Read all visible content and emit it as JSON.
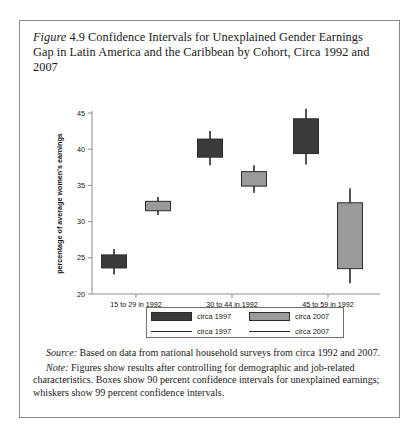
{
  "figure": {
    "label": "Figure",
    "number": "4.9",
    "title": "Confidence Intervals for Unexplained Gender Earnings Gap in Latin America and the Caribbean by Cohort, Circa 1992 and 2007"
  },
  "notes": {
    "source_lead": "Source:",
    "source_text": " Based on data from national household surveys from circa 1992 and 2007.",
    "note_lead": "Note:",
    "note_text": " Figures show results after controlling for demographic and job-related characteristics. Boxes show 90 percent confidence intervals for unexplained earnings; whiskers show 99 percent confidence intervals."
  },
  "legend": {
    "box_1997": "circa 1997",
    "box_2007": "circa 2007",
    "line_1997": "circa 1997",
    "line_2007": "circa 2007"
  },
  "colors": {
    "series_1997": "#3a3a3a",
    "series_2007": "#9a9a9a",
    "outline": "#2b2b2b",
    "axis": "#8c8c8c",
    "frame": "#8a8a8a"
  },
  "chart_data": {
    "type": "bar",
    "title": "Confidence Intervals for Unexplained Gender Earnings Gap in Latin America and the Caribbean by Cohort, Circa 1992 and 2007",
    "xlabel": "cohort",
    "ylabel": "percentage of average women's earnings",
    "ylim": [
      20,
      45
    ],
    "yticks": [
      20,
      25,
      30,
      35,
      40,
      45
    ],
    "ytick_labels": [
      "20",
      "25",
      "30",
      "35",
      "40",
      "45"
    ],
    "grid": false,
    "legend_position": "below-axis",
    "categories": [
      "15 to 29 in 1992",
      "30 to 44 in 1992",
      "45 to 59 in 1992"
    ],
    "series": [
      {
        "name": "circa 1997",
        "color": "#3a3a3a",
        "box_low": [
          23.6,
          38.9,
          39.4
        ],
        "box_high": [
          25.4,
          41.4,
          44.2
        ],
        "whisker_low": [
          22.7,
          37.8,
          37.9
        ],
        "whisker_high": [
          26.2,
          42.5,
          45.6
        ]
      },
      {
        "name": "circa 2007",
        "color": "#9a9a9a",
        "box_low": [
          31.5,
          34.9,
          23.5
        ],
        "box_high": [
          32.8,
          36.9,
          32.6
        ],
        "whisker_low": [
          30.9,
          34.0,
          21.5
        ],
        "whisker_high": [
          33.4,
          37.8,
          34.6
        ]
      }
    ]
  }
}
